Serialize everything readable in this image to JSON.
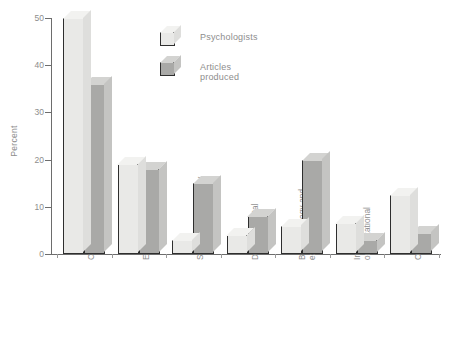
{
  "chart_data": {
    "type": "bar",
    "title": "",
    "xlabel": "",
    "ylabel": "Percent",
    "ylim": [
      0,
      50
    ],
    "yticks": [
      0,
      10,
      20,
      30,
      40,
      50
    ],
    "grid": false,
    "legend_position": "top-right",
    "categories": [
      "Clinical/counseling",
      "Educational/school",
      "Social and personality",
      "Developmental",
      "Biopsychology and experimental",
      "Industrial/organizational",
      "Other"
    ],
    "category_lines": [
      [
        "Clinical/counseling"
      ],
      [
        "Educational/school"
      ],
      [
        "Social and personality"
      ],
      [
        "Developmental"
      ],
      [
        "Biopsychology and",
        "experimental"
      ],
      [
        "Industrial/",
        "organizational"
      ],
      [
        "Other"
      ]
    ],
    "series": [
      {
        "name": "Psychologists",
        "color": "#e9e9e7",
        "values": [
          50,
          19,
          3,
          4,
          6,
          6.5,
          12.5
        ]
      },
      {
        "name": "Articles produced",
        "color": "#a9a9a7",
        "values": [
          36,
          18,
          15,
          8,
          20,
          3,
          4.5
        ]
      }
    ]
  },
  "legend": {
    "items": [
      {
        "label": "Psychologists"
      },
      {
        "label": "Articles produced"
      }
    ]
  },
  "axis": {
    "y_title": "Percent",
    "y_tick_labels": [
      "0",
      "10",
      "20",
      "30",
      "40",
      "50"
    ]
  }
}
